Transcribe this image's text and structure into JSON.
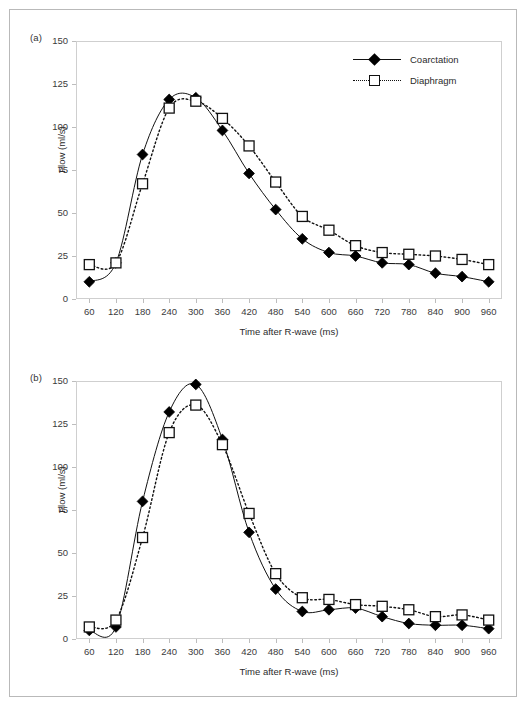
{
  "figure": {
    "panels": [
      {
        "id": "a",
        "label": "(a)"
      },
      {
        "id": "b",
        "label": "(b)"
      }
    ]
  },
  "legend": {
    "position": "top-right",
    "entries": [
      {
        "name": "Coarctation",
        "marker": "filled-diamond",
        "line": "solid",
        "color": "#000000"
      },
      {
        "name": "Diaphragm",
        "marker": "open-square",
        "line": "dotted",
        "color": "#000000"
      }
    ]
  },
  "axes": {
    "xlabel": "Time after R-wave (ms)",
    "ylabel": "Flow (ml/s)",
    "yticks": [
      "150",
      "125",
      "100",
      "75",
      "50",
      "25",
      "0"
    ],
    "xticks": [
      "60",
      "120",
      "180",
      "240",
      "300",
      "360",
      "420",
      "480",
      "540",
      "600",
      "660",
      "720",
      "780",
      "840",
      "900",
      "960"
    ]
  },
  "chart_data": [
    {
      "type": "line",
      "panel": "(a)",
      "title": "",
      "xlabel": "Time after R-wave (ms)",
      "ylabel": "Flow (ml/s)",
      "xlim": [
        60,
        960
      ],
      "ylim": [
        0,
        150
      ],
      "yticks": [
        0,
        25,
        50,
        75,
        100,
        125,
        150
      ],
      "grid": false,
      "legend_position": "top-right",
      "x": [
        60,
        120,
        180,
        240,
        300,
        360,
        420,
        480,
        540,
        600,
        660,
        720,
        780,
        840,
        900,
        960
      ],
      "series": [
        {
          "name": "Coarctation",
          "marker": "filled-diamond",
          "line": "solid",
          "values": [
            10,
            21,
            84,
            116,
            117,
            98,
            73,
            52,
            35,
            27,
            25,
            21,
            20,
            15,
            13,
            10
          ]
        },
        {
          "name": "Diaphragm",
          "marker": "open-square",
          "line": "dotted",
          "values": [
            20,
            21,
            67,
            111,
            115,
            105,
            89,
            68,
            48,
            40,
            31,
            27,
            26,
            25,
            23,
            20
          ]
        }
      ]
    },
    {
      "type": "line",
      "panel": "(b)",
      "title": "",
      "xlabel": "Time after R-wave (ms)",
      "ylabel": "Flow (ml/s)",
      "xlim": [
        60,
        960
      ],
      "ylim": [
        0,
        150
      ],
      "yticks": [
        0,
        25,
        50,
        75,
        100,
        125,
        150
      ],
      "grid": false,
      "legend_position": "none",
      "x": [
        60,
        120,
        180,
        240,
        300,
        360,
        420,
        480,
        540,
        600,
        660,
        720,
        780,
        840,
        900,
        960
      ],
      "series": [
        {
          "name": "Coarctation",
          "marker": "filled-diamond",
          "line": "solid",
          "values": [
            5,
            7,
            80,
            132,
            148,
            116,
            62,
            29,
            16,
            17,
            18,
            13,
            9,
            8,
            8,
            6
          ]
        },
        {
          "name": "Diaphragm",
          "marker": "open-square",
          "line": "dotted",
          "values": [
            7,
            11,
            59,
            120,
            136,
            113,
            73,
            38,
            24,
            23,
            20,
            19,
            17,
            13,
            14,
            11
          ]
        }
      ]
    }
  ]
}
